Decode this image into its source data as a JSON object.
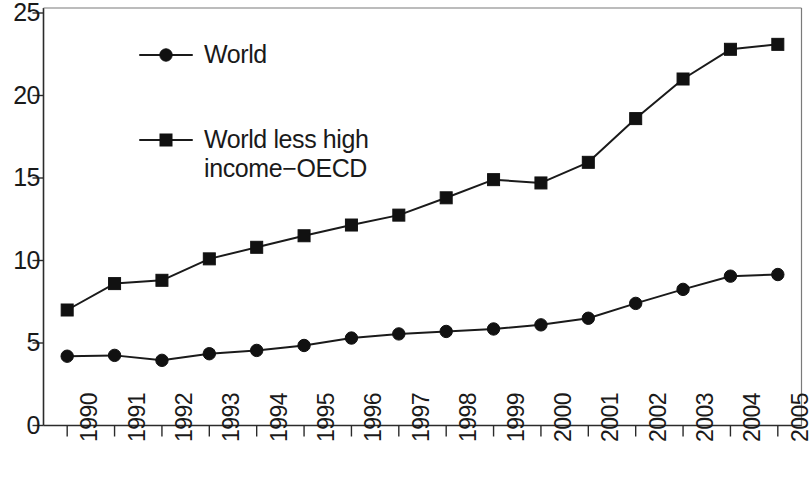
{
  "chart_data": {
    "type": "line",
    "title": "",
    "subtitle": "",
    "xlabel": "",
    "ylabel": "",
    "categories": [
      "1990",
      "1991",
      "1992",
      "1993",
      "1994",
      "1995",
      "1996",
      "1997",
      "1998",
      "1999",
      "2000",
      "2001",
      "2002",
      "2003",
      "2004",
      "2005"
    ],
    "x": [
      1990,
      1991,
      1992,
      1993,
      1994,
      1995,
      1996,
      1997,
      1998,
      1999,
      2000,
      2001,
      2002,
      2003,
      2004,
      2005
    ],
    "series": [
      {
        "name": "World",
        "marker": "circle",
        "values": [
          4.2,
          4.25,
          3.95,
          4.35,
          4.55,
          4.85,
          5.3,
          5.55,
          5.7,
          5.85,
          6.1,
          6.5,
          7.4,
          8.25,
          9.05,
          9.15
        ]
      },
      {
        "name": "World less high income−OECD",
        "marker": "square",
        "values": [
          7.0,
          8.6,
          8.8,
          10.1,
          10.8,
          11.5,
          12.15,
          12.75,
          13.8,
          14.9,
          14.7,
          15.95,
          18.6,
          21.0,
          22.8,
          23.1
        ]
      }
    ],
    "ylim": [
      0,
      25
    ],
    "yticks": [
      0,
      5,
      10,
      15,
      20,
      25
    ],
    "ytick_labels": [
      "0",
      "5",
      "10",
      "15",
      "20",
      "25"
    ],
    "xtick_labels": [
      "1990",
      "1991",
      "1992",
      "1993",
      "1994",
      "1995",
      "1996",
      "1997",
      "1998",
      "1999",
      "2000",
      "2001",
      "2002",
      "2003",
      "2004",
      "2005"
    ],
    "grid": false,
    "legend_position": "upper-left-inside",
    "line_color": "#111111",
    "axis_color": "#2b2b2b"
  },
  "legend": {
    "entries": [
      {
        "label": "World",
        "marker": "circle"
      },
      {
        "label": "World less high\nincome−OECD",
        "marker": "square"
      }
    ]
  }
}
